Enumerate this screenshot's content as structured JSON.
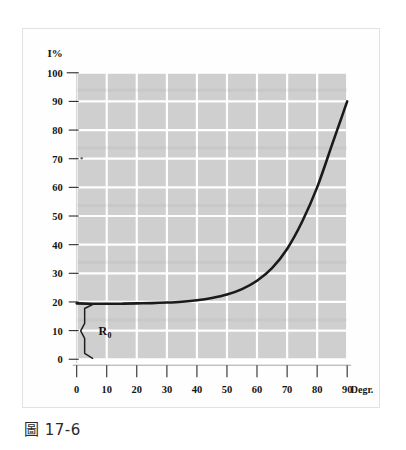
{
  "figure": {
    "caption": "圖 17-6",
    "caption_prefix": "圖",
    "caption_number": "17-6"
  },
  "chart_data": {
    "type": "line",
    "title": "",
    "subtitle": "",
    "xlabel": "Degr.",
    "ylabel": "I%",
    "xlim": [
      0,
      90
    ],
    "ylim": [
      0,
      100
    ],
    "xticks": [
      0,
      10,
      20,
      30,
      40,
      50,
      60,
      70,
      80,
      90
    ],
    "xtick_labels": [
      "0",
      "10",
      "20",
      "30",
      "40",
      "50",
      "60",
      "70",
      "80",
      "90"
    ],
    "yticks": [
      0,
      10,
      20,
      30,
      40,
      50,
      60,
      70,
      80,
      90,
      100
    ],
    "ytick_labels": [
      "0",
      "10",
      "20",
      "30",
      "40",
      "50",
      "60",
      "70",
      "80",
      "90",
      "100"
    ],
    "grid": true,
    "grid_color": "#ffffff",
    "plot_background": "#cfcfcf",
    "line_color": "#1a1a1a",
    "line_width": 2.6,
    "legend": null,
    "legend_position": "none",
    "x": [
      0,
      5,
      10,
      15,
      20,
      25,
      30,
      35,
      40,
      45,
      50,
      55,
      60,
      65,
      70,
      75,
      80,
      85,
      88,
      90
    ],
    "y": [
      19.5,
      19.4,
      19.4,
      19.4,
      19.5,
      19.6,
      19.8,
      20.1,
      20.6,
      21.4,
      22.6,
      24.5,
      27.4,
      31.8,
      38.5,
      48.0,
      60.0,
      75.0,
      84.0,
      90.0
    ],
    "series": [
      {
        "name": "reflectance",
        "values": [
          19.5,
          19.4,
          19.4,
          19.4,
          19.5,
          19.6,
          19.8,
          20.1,
          20.6,
          21.4,
          22.6,
          24.5,
          27.4,
          31.8,
          38.5,
          48.0,
          60.0,
          75.0,
          84.0,
          90.0
        ]
      }
    ],
    "annotations": [
      {
        "name": "R0-brace",
        "label": "R",
        "subscript": "0",
        "type": "brace",
        "x": 0,
        "y_from": 0,
        "y_to": 19.5
      }
    ]
  }
}
